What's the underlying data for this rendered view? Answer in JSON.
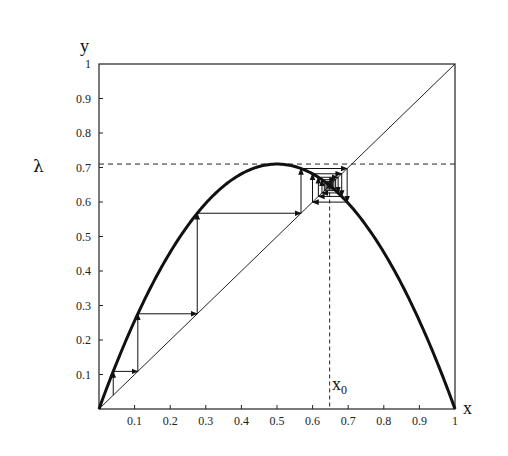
{
  "chart_data": {
    "type": "line",
    "title": "",
    "xlabel": "x",
    "ylabel": "y",
    "lambda_label": "λ",
    "x0_label": "x",
    "x0_subscript": "0",
    "xlim": [
      0,
      1
    ],
    "ylim": [
      0,
      1
    ],
    "grid": false,
    "legend": null,
    "x_ticks": [
      "0.1",
      "0.2",
      "0.3",
      "0.4",
      "0.5",
      "0.6",
      "0.7",
      "0.8",
      "0.9",
      "1"
    ],
    "y_ticks": [
      "0.1",
      "0.2",
      "0.3",
      "0.4",
      "0.5",
      "0.6",
      "0.7",
      "0.8",
      "0.9",
      "1"
    ],
    "lambda": 0.71,
    "fixed_point_x0": 0.648,
    "series": [
      {
        "name": "parabola",
        "function": "y = 4*0.71*x*(1-x)",
        "style": "thick"
      },
      {
        "name": "diagonal",
        "function": "y = x",
        "style": "thin"
      },
      {
        "name": "cobweb",
        "start_x": 0.04,
        "iterations": 28,
        "style": "arrows"
      }
    ],
    "reference_lines": [
      {
        "type": "horizontal",
        "y": 0.71,
        "style": "dashed",
        "label": "λ"
      },
      {
        "type": "vertical",
        "x": 0.648,
        "style": "dashed",
        "label": "x0"
      }
    ],
    "cobweb_points_x": [
      0.04,
      0.109,
      0.276,
      0.567,
      0.697,
      0.6,
      0.682,
      0.616,
      0.672,
      0.626,
      0.665,
      0.632,
      0.66,
      0.637
    ]
  }
}
